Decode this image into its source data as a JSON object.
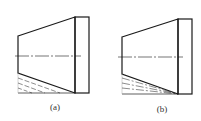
{
  "figures": [
    {
      "id": "a",
      "label": "(a)",
      "description": "truncated cone side view with flange; dashed taper lines below lower edge"
    },
    {
      "id": "b",
      "label": "(b)",
      "description": "truncated cone side view with flange; dash-dot fan lines converging to lower corner"
    }
  ],
  "colors": {
    "stroke": "#1a1a1a",
    "background": "#ffffff"
  }
}
